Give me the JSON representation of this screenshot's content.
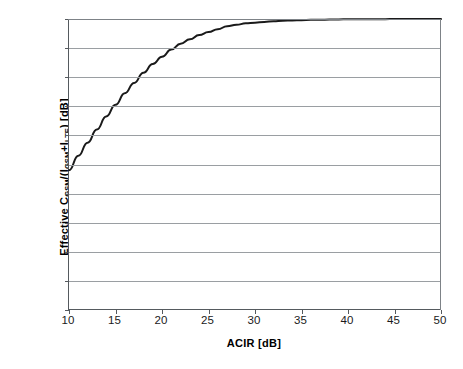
{
  "chart_data": {
    "type": "line",
    "title": "",
    "xlabel": "ACIR [dB]",
    "ylabel": "Effective C_GSM/(I_GSM+I_LTE) [dB]",
    "ylabel_parts": {
      "prefix": "Effective C",
      "sub1": "GSM",
      "mid": "/(I",
      "sub2": "GSM",
      "plus": "+I",
      "sub3": "LTE",
      "suffix": ") [dB]"
    },
    "xlim": [
      10,
      50
    ],
    "ylim": [
      0,
      20
    ],
    "xticks": [
      10,
      15,
      20,
      25,
      30,
      35,
      40,
      45,
      50
    ],
    "yticks": [
      0,
      2,
      4,
      6,
      8,
      10,
      12,
      14,
      16,
      18,
      20
    ],
    "grid": "horizontal",
    "legend": "none",
    "line_color": "#1a1a1a",
    "grid_color": "#9a9ea2",
    "axis_color": "#555a5e",
    "background": "#ffffff",
    "series": [
      {
        "name": "Effective C/(I_GSM+I_LTE)",
        "x": [
          10,
          11,
          12,
          13,
          14,
          15,
          16,
          17,
          18,
          19,
          20,
          21,
          22,
          23,
          24,
          25,
          26,
          27,
          28,
          29,
          30,
          31,
          32,
          33,
          34,
          35,
          36,
          37,
          38,
          39,
          40,
          41,
          42,
          43,
          44,
          45,
          46,
          47,
          48,
          49,
          50
        ],
        "y": [
          9.6,
          10.6,
          11.5,
          12.4,
          13.3,
          14.1,
          14.9,
          15.6,
          16.3,
          16.9,
          17.4,
          17.9,
          18.3,
          18.6,
          18.9,
          19.1,
          19.3,
          19.5,
          19.6,
          19.7,
          19.75,
          19.8,
          19.85,
          19.88,
          19.9,
          19.92,
          19.94,
          19.95,
          19.96,
          19.97,
          19.98,
          19.98,
          19.99,
          19.99,
          19.99,
          20.0,
          20.0,
          20.0,
          20.0,
          20.0,
          20.0
        ]
      }
    ]
  }
}
